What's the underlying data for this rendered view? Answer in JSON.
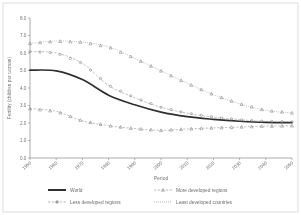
{
  "chart_data": {
    "type": "line",
    "title": "",
    "xlabel": "Period",
    "ylabel": "Fertility (children per woman)",
    "ylim": [
      0.0,
      8.0
    ],
    "grid": false,
    "legend_position": "bottom",
    "categories": [
      "1950-1955",
      "1960-1965",
      "1970-1975",
      "1980-1985",
      "1990-1995",
      "2000-2005",
      "2010-2015",
      "2020-2025",
      "2030-2035",
      "2040-2045",
      "2045-2050"
    ],
    "x_tick_labels": [
      "1950",
      "1960",
      "1970",
      "1980",
      "1990",
      "2000",
      "2010",
      "2020",
      "2030",
      "2040",
      "2050"
    ],
    "y_tick_labels": [
      "0.0",
      "1.0",
      "2.0",
      "3.0",
      "4.0",
      "5.0",
      "6.0",
      "7.0",
      "8.0"
    ],
    "y_ticks": [
      0.0,
      1.0,
      2.0,
      3.0,
      4.0,
      5.0,
      6.0,
      7.0,
      8.0
    ],
    "series": [
      {
        "name": "World",
        "marker": "none",
        "line": "solid-thick",
        "color": "#1a1a1a",
        "values": [
          5.02,
          4.98,
          4.48,
          3.59,
          3.04,
          2.62,
          2.36,
          2.21,
          2.1,
          2.03,
          2.02
        ]
      },
      {
        "name": "More developed regions",
        "marker": "triangle",
        "line": "dashed",
        "color": "#7a7a7a",
        "values": [
          2.82,
          2.67,
          2.12,
          1.85,
          1.68,
          1.58,
          1.66,
          1.72,
          1.77,
          1.82,
          1.84
        ]
      },
      {
        "name": "Less developed regions",
        "marker": "circle",
        "line": "dashed",
        "color": "#808080",
        "values": [
          6.08,
          6.0,
          5.41,
          4.15,
          3.44,
          2.9,
          2.56,
          2.34,
          2.19,
          2.09,
          2.07
        ]
      },
      {
        "name": "Least developed countries",
        "marker": "triangle-open",
        "line": "dotted",
        "color": "#8a8a8a",
        "values": [
          6.55,
          6.68,
          6.62,
          6.35,
          5.7,
          4.98,
          4.27,
          3.62,
          3.1,
          2.72,
          2.58
        ]
      }
    ]
  },
  "legend": {
    "items": [
      {
        "label": "World",
        "key": "world"
      },
      {
        "label": "More developed regions",
        "key": "more-developed-regions"
      },
      {
        "label": "Less developed regions",
        "key": "less-developed-regions"
      },
      {
        "label": "Least developed countries",
        "key": "least-developed-countries"
      }
    ]
  },
  "axes": {
    "x_title": "Period",
    "y_title": "Fertility (children per woman)"
  }
}
